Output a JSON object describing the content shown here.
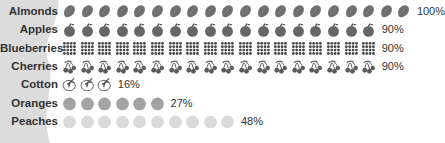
{
  "chart_data": {
    "type": "pictograph",
    "title": "",
    "categories": [
      "Almonds",
      "Apples",
      "Blueberries",
      "Cherries",
      "Cotton",
      "Oranges",
      "Peaches"
    ],
    "values": [
      100,
      90,
      90,
      90,
      16,
      27,
      48
    ],
    "value_labels": [
      "100%",
      "90%",
      "90%",
      "90%",
      "16%",
      "27%",
      "48%"
    ],
    "icon_counts": [
      20,
      18,
      18,
      18,
      3,
      6,
      10
    ],
    "icons": [
      "almond-icon",
      "apple-icon",
      "blueberry-icon",
      "cherry-icon",
      "cotton-icon",
      "orange-icon",
      "peach-icon"
    ],
    "colors": {
      "almonds": "#6e6e6e",
      "apples": "#666666",
      "blueberries": "#4a4a4a",
      "cherries": "#5c5c5c",
      "cotton": "#555555",
      "oranges": "#a3a3a3",
      "peaches": "#dadada",
      "label": "#333333",
      "background_shape": "#dcdcdc"
    },
    "xlabel": "",
    "ylabel": "",
    "legend": "none",
    "grid": false
  }
}
